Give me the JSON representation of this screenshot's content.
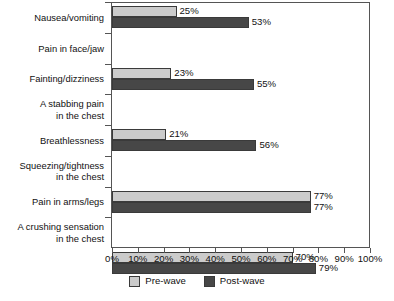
{
  "chart_data": {
    "type": "bar",
    "orientation": "horizontal",
    "title": "",
    "subtitle": "",
    "xlabel": "",
    "ylabel": "",
    "xlim": [
      0,
      100
    ],
    "xticks": [
      0,
      10,
      20,
      30,
      40,
      50,
      60,
      70,
      80,
      90,
      100
    ],
    "xtick_labels": [
      "0%",
      "10%",
      "20%",
      "30%",
      "40%",
      "50%",
      "60%",
      "70%",
      "80%",
      "90%",
      "100%"
    ],
    "grid": false,
    "legend_position": "bottom-center",
    "value_suffix": "%",
    "categories": [
      "Nausea/vomiting",
      "Pain in face/jaw",
      "Fainting/dizziness",
      "A stabbing pain\nin the chest",
      "Breathlessness",
      "Squeezing/tightness\nin the chest",
      "Pain in arms/legs",
      "A crushing sensation\nin the chest"
    ],
    "series": [
      {
        "name": "Pre-wave",
        "color": "#cbcbcb",
        "values": [
          25,
          23,
          21,
          77,
          70,
          80,
          87,
          82
        ],
        "labels": [
          "25%",
          "23%",
          "21%",
          "77%",
          "70%",
          "80%",
          "87%",
          "82%"
        ]
      },
      {
        "name": "Post-wave",
        "color": "#474747",
        "values": [
          53,
          55,
          56,
          77,
          79,
          87,
          88,
          93
        ],
        "labels": [
          "53%",
          "55%",
          "56%",
          "77%",
          "79%",
          "87%",
          "88%",
          "93%"
        ]
      }
    ]
  }
}
